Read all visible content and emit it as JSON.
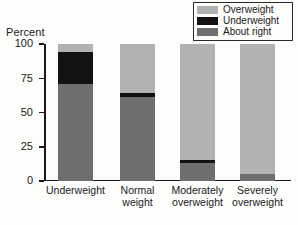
{
  "chart_data": {
    "type": "bar",
    "subtype": "stacked-100-percent",
    "title": "",
    "xlabel": "",
    "ylabel": "Percent",
    "ylim": [
      0,
      100
    ],
    "yticks": [
      0,
      25,
      50,
      75,
      100
    ],
    "ytick_labels": [
      "0",
      "25",
      "50",
      "75",
      "100"
    ],
    "grid": false,
    "legend_position": "top-right",
    "categories": [
      "Underweight",
      "Normal\nweight",
      "Moderately\noverweight",
      "Severely\noverweight"
    ],
    "series": [
      {
        "name": "About right",
        "color": "#6e6e6e",
        "values": [
          71,
          61,
          13,
          5
        ]
      },
      {
        "name": "Underweight",
        "color": "#121212",
        "values": [
          23,
          3,
          2,
          0
        ]
      },
      {
        "name": "Overweight",
        "color": "#b2b2b2",
        "values": [
          6,
          36,
          85,
          95
        ]
      }
    ]
  },
  "axis": {
    "y_title": "Percent",
    "ticks": [
      {
        "label": "100",
        "value": 100
      },
      {
        "label": "75",
        "value": 75
      },
      {
        "label": "50",
        "value": 50
      },
      {
        "label": "25",
        "value": 25
      },
      {
        "label": "0",
        "value": 0
      }
    ]
  },
  "legend": {
    "items": [
      {
        "label": "Overweight",
        "color": "#b2b2b2"
      },
      {
        "label": "Underweight",
        "color": "#121212"
      },
      {
        "label": "About right",
        "color": "#6e6e6e"
      }
    ]
  }
}
